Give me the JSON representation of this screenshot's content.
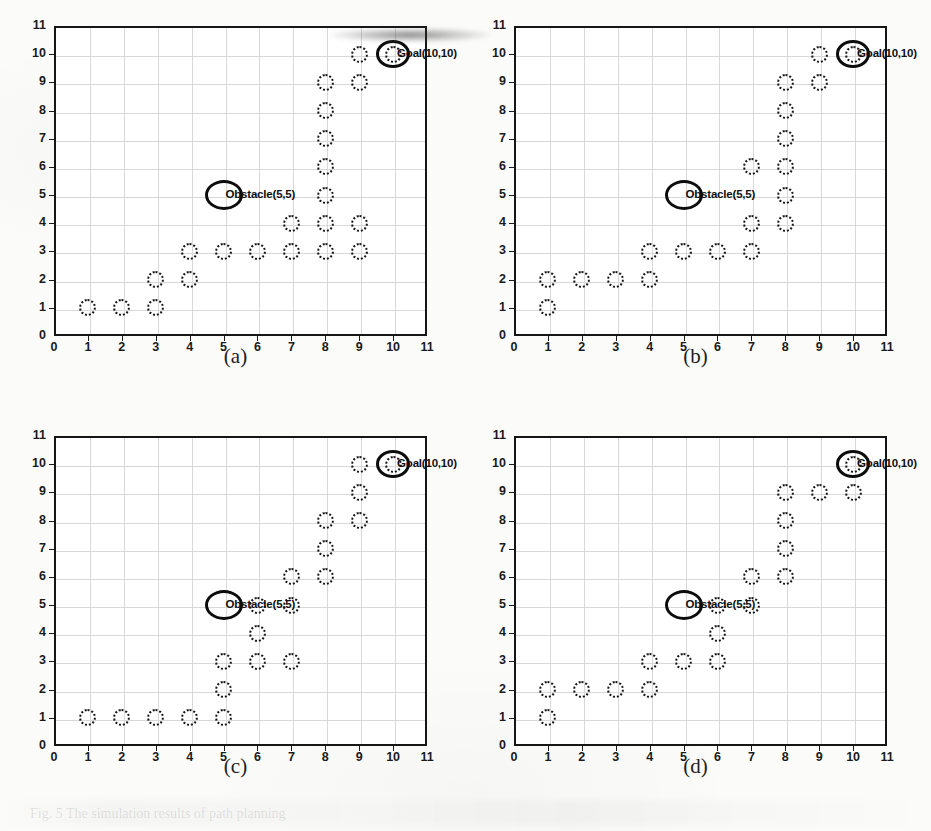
{
  "figure": {
    "background_color": "#fbfbfa",
    "axis_color": "#161616",
    "grid_color": "#d8d8d8",
    "marker_color": "#151515",
    "caption_ghost": "Fig. 5  The simulation results of path planning"
  },
  "axes_common": {
    "xlabel": "",
    "ylabel": "",
    "xlim": [
      0,
      11
    ],
    "ylim": [
      0,
      11
    ],
    "xticks": [
      0,
      1,
      2,
      3,
      4,
      5,
      6,
      7,
      8,
      9,
      10,
      11
    ],
    "yticks": [
      0,
      1,
      2,
      3,
      4,
      5,
      6,
      7,
      8,
      9,
      10,
      11
    ],
    "grid": true,
    "obstacle_label": "Obstacle(5,5)",
    "goal_label": "Goal(10,10)",
    "obstacle_point": [
      5,
      5
    ],
    "goal_point": [
      10,
      10
    ]
  },
  "chart_data": [
    {
      "id": "a",
      "type": "scatter",
      "title": "",
      "caption": "(a)",
      "xlabel": "",
      "ylabel": "",
      "xlim": [
        0,
        11
      ],
      "ylim": [
        0,
        11
      ],
      "grid": true,
      "series": [
        {
          "name": "path-nodes",
          "marker": "dotted-circle",
          "points": [
            [
              1,
              1
            ],
            [
              2,
              1
            ],
            [
              3,
              1
            ],
            [
              3,
              2
            ],
            [
              4,
              2
            ],
            [
              4,
              3
            ],
            [
              5,
              3
            ],
            [
              6,
              3
            ],
            [
              7,
              3
            ],
            [
              8,
              3
            ],
            [
              9,
              3
            ],
            [
              7,
              4
            ],
            [
              8,
              4
            ],
            [
              9,
              4
            ],
            [
              8,
              5
            ],
            [
              8,
              6
            ],
            [
              8,
              7
            ],
            [
              8,
              8
            ],
            [
              8,
              9
            ],
            [
              9,
              9
            ],
            [
              9,
              10
            ],
            [
              10,
              10
            ]
          ]
        }
      ],
      "annotations": [
        {
          "name": "obstacle",
          "label": "Obstacle(5,5)",
          "x": 5,
          "y": 5,
          "shape": "bold-ellipse"
        },
        {
          "name": "goal",
          "label": "Goal(10,10)",
          "x": 10,
          "y": 10,
          "shape": "bold-ellipse"
        }
      ]
    },
    {
      "id": "b",
      "type": "scatter",
      "title": "",
      "caption": "(b)",
      "xlabel": "",
      "ylabel": "",
      "xlim": [
        0,
        11
      ],
      "ylim": [
        0,
        11
      ],
      "grid": true,
      "series": [
        {
          "name": "path-nodes",
          "marker": "dotted-circle",
          "points": [
            [
              1,
              1
            ],
            [
              1,
              2
            ],
            [
              2,
              2
            ],
            [
              3,
              2
            ],
            [
              4,
              2
            ],
            [
              4,
              3
            ],
            [
              5,
              3
            ],
            [
              6,
              3
            ],
            [
              7,
              3
            ],
            [
              7,
              4
            ],
            [
              8,
              4
            ],
            [
              8,
              5
            ],
            [
              7,
              6
            ],
            [
              8,
              6
            ],
            [
              8,
              7
            ],
            [
              8,
              8
            ],
            [
              8,
              9
            ],
            [
              9,
              9
            ],
            [
              9,
              10
            ],
            [
              10,
              10
            ]
          ]
        }
      ],
      "annotations": [
        {
          "name": "obstacle",
          "label": "Obstacle(5,5)",
          "x": 5,
          "y": 5,
          "shape": "bold-ellipse"
        },
        {
          "name": "goal",
          "label": "Goal(10,10)",
          "x": 10,
          "y": 10,
          "shape": "bold-ellipse"
        }
      ]
    },
    {
      "id": "c",
      "type": "scatter",
      "title": "",
      "caption": "(c)",
      "xlabel": "",
      "ylabel": "",
      "xlim": [
        0,
        11
      ],
      "ylim": [
        0,
        11
      ],
      "grid": true,
      "series": [
        {
          "name": "path-nodes",
          "marker": "dotted-circle",
          "points": [
            [
              1,
              1
            ],
            [
              2,
              1
            ],
            [
              3,
              1
            ],
            [
              4,
              1
            ],
            [
              5,
              1
            ],
            [
              5,
              2
            ],
            [
              5,
              3
            ],
            [
              6,
              3
            ],
            [
              7,
              3
            ],
            [
              6,
              4
            ],
            [
              6,
              5
            ],
            [
              7,
              5
            ],
            [
              7,
              6
            ],
            [
              8,
              6
            ],
            [
              8,
              7
            ],
            [
              8,
              8
            ],
            [
              9,
              8
            ],
            [
              9,
              9
            ],
            [
              9,
              10
            ],
            [
              10,
              10
            ]
          ]
        }
      ],
      "annotations": [
        {
          "name": "obstacle",
          "label": "Obstacle(5,5)",
          "x": 5,
          "y": 5,
          "shape": "bold-ellipse"
        },
        {
          "name": "goal",
          "label": "Goal(10,10)",
          "x": 10,
          "y": 10,
          "shape": "bold-ellipse"
        }
      ]
    },
    {
      "id": "d",
      "type": "scatter",
      "title": "",
      "caption": "(d)",
      "xlabel": "",
      "ylabel": "",
      "xlim": [
        0,
        11
      ],
      "ylim": [
        0,
        11
      ],
      "grid": true,
      "series": [
        {
          "name": "path-nodes",
          "marker": "dotted-circle",
          "points": [
            [
              1,
              1
            ],
            [
              1,
              2
            ],
            [
              2,
              2
            ],
            [
              3,
              2
            ],
            [
              4,
              2
            ],
            [
              4,
              3
            ],
            [
              5,
              3
            ],
            [
              6,
              3
            ],
            [
              6,
              4
            ],
            [
              6,
              5
            ],
            [
              7,
              5
            ],
            [
              7,
              6
            ],
            [
              8,
              6
            ],
            [
              8,
              7
            ],
            [
              8,
              8
            ],
            [
              8,
              9
            ],
            [
              9,
              9
            ],
            [
              10,
              9
            ],
            [
              10,
              10
            ]
          ]
        }
      ],
      "annotations": [
        {
          "name": "obstacle",
          "label": "Obstacle(5,5)",
          "x": 5,
          "y": 5,
          "shape": "bold-ellipse"
        },
        {
          "name": "goal",
          "label": "Goal(10,10)",
          "x": 10,
          "y": 10,
          "shape": "bold-ellipse"
        }
      ]
    }
  ]
}
